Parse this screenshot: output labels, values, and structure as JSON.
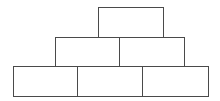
{
  "diagram": {
    "type": "pyramid",
    "stroke_color": "#4a4a4a",
    "background": "#ffffff",
    "rows": [
      {
        "row": "top",
        "boxes": [
          {
            "x": 98,
            "y": 7,
            "w": 66,
            "h": 31,
            "label": ""
          }
        ]
      },
      {
        "row": "middle",
        "boxes": [
          {
            "x": 55,
            "y": 37,
            "w": 65,
            "h": 30,
            "label": ""
          },
          {
            "x": 119,
            "y": 37,
            "w": 66,
            "h": 30,
            "label": ""
          }
        ]
      },
      {
        "row": "bottom",
        "boxes": [
          {
            "x": 13,
            "y": 66,
            "w": 65,
            "h": 31,
            "label": ""
          },
          {
            "x": 77,
            "y": 66,
            "w": 66,
            "h": 31,
            "label": ""
          },
          {
            "x": 142,
            "y": 66,
            "w": 67,
            "h": 31,
            "label": ""
          }
        ]
      }
    ]
  }
}
